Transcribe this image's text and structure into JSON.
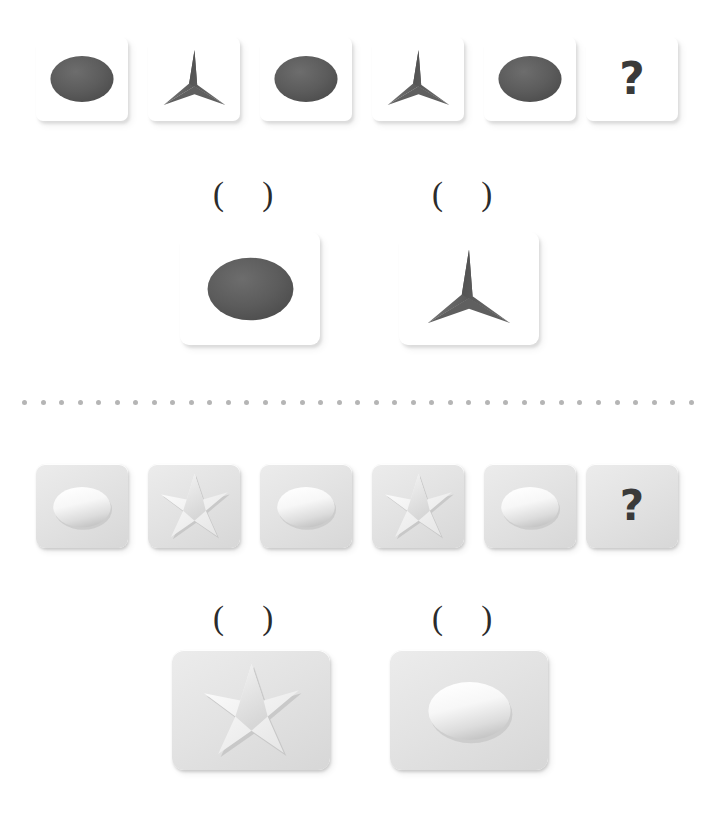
{
  "page": {
    "background_color": "#ffffff",
    "width": 716,
    "height": 831
  },
  "divider": {
    "name": "dotted-separator",
    "dot_count": 37,
    "dot_color": "#b5b5b5",
    "dot_size_px": 5,
    "x": 22,
    "y": 400,
    "width": 672
  },
  "puzzles": [
    {
      "id": "puzzle-top",
      "style": "white-flat-cards",
      "card_color": "#ffffff",
      "shape_color": "#595959",
      "sequence": {
        "name": "top-sequence-row",
        "cells": [
          {
            "name": "sequence-cell-1",
            "shape": "ellipse",
            "label": "",
            "x": 36,
            "y": 37,
            "w": 92,
            "h": 84
          },
          {
            "name": "sequence-cell-2",
            "shape": "star-3",
            "label": "",
            "x": 148,
            "y": 37,
            "w": 92,
            "h": 84
          },
          {
            "name": "sequence-cell-3",
            "shape": "ellipse",
            "label": "",
            "x": 260,
            "y": 37,
            "w": 92,
            "h": 84
          },
          {
            "name": "sequence-cell-4",
            "shape": "star-3",
            "label": "",
            "x": 372,
            "y": 37,
            "w": 92,
            "h": 84
          },
          {
            "name": "sequence-cell-5",
            "shape": "ellipse",
            "label": "",
            "x": 484,
            "y": 37,
            "w": 92,
            "h": 84
          },
          {
            "name": "sequence-cell-6",
            "shape": "question-mark",
            "label": "?",
            "x": 586,
            "y": 37,
            "w": 92,
            "h": 84
          }
        ]
      },
      "options": {
        "name": "top-options-row",
        "blank_label": "(  )",
        "items": [
          {
            "name": "option-card-a",
            "shape": "ellipse",
            "blank_x": 213,
            "blank_y": 178,
            "x": 180,
            "y": 232,
            "w": 140,
            "h": 113
          },
          {
            "name": "option-card-b",
            "shape": "star-3",
            "blank_x": 432,
            "blank_y": 178,
            "x": 399,
            "y": 232,
            "w": 140,
            "h": 113
          }
        ]
      }
    },
    {
      "id": "puzzle-bottom",
      "style": "gray-embossed-cards",
      "card_color": "#e3e3e3",
      "shape_color": "#f2f2f2",
      "sequence": {
        "name": "bottom-sequence-row",
        "cells": [
          {
            "name": "sequence-cell-1",
            "shape": "ellipse",
            "label": "",
            "x": 36,
            "y": 464,
            "w": 92,
            "h": 84
          },
          {
            "name": "sequence-cell-2",
            "shape": "star-4",
            "label": "",
            "x": 148,
            "y": 464,
            "w": 92,
            "h": 84
          },
          {
            "name": "sequence-cell-3",
            "shape": "ellipse",
            "label": "",
            "x": 260,
            "y": 464,
            "w": 92,
            "h": 84
          },
          {
            "name": "sequence-cell-4",
            "shape": "star-4",
            "label": "",
            "x": 372,
            "y": 464,
            "w": 92,
            "h": 84
          },
          {
            "name": "sequence-cell-5",
            "shape": "ellipse",
            "label": "",
            "x": 484,
            "y": 464,
            "w": 92,
            "h": 84
          },
          {
            "name": "sequence-cell-6",
            "shape": "question-mark",
            "label": "?",
            "x": 586,
            "y": 464,
            "w": 92,
            "h": 84
          }
        ]
      },
      "options": {
        "name": "bottom-options-row",
        "blank_label": "(  )",
        "items": [
          {
            "name": "option-card-a",
            "shape": "star-4",
            "blank_x": 213,
            "blank_y": 602,
            "x": 172,
            "y": 650,
            "w": 158,
            "h": 120
          },
          {
            "name": "option-card-b",
            "shape": "ellipse",
            "blank_x": 432,
            "blank_y": 602,
            "x": 390,
            "y": 650,
            "w": 158,
            "h": 120
          }
        ]
      }
    }
  ]
}
